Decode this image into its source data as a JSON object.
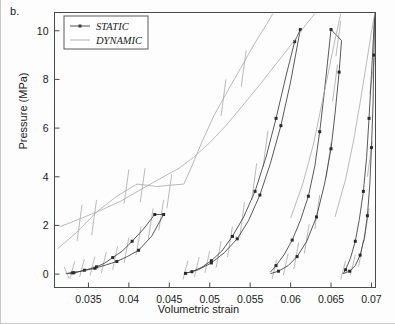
{
  "figure": {
    "panel_label": "b.",
    "background": "#fdfdfd"
  },
  "chart_data": {
    "type": "line",
    "title": "",
    "xlabel": "Volumetric strain",
    "ylabel": "Pressure (MPa)",
    "xlim": [
      0.0308,
      0.0705
    ],
    "ylim": [
      -0.55,
      10.75
    ],
    "xticks": [
      0.035,
      0.04,
      0.045,
      0.05,
      0.055,
      0.06,
      0.065,
      0.07
    ],
    "xticklabels": [
      "0.035",
      "0.04",
      "0.045",
      "0.05",
      "0.055",
      "0.06",
      "0.065",
      "0.07"
    ],
    "yticks": [
      0,
      2,
      4,
      6,
      8,
      10
    ],
    "yticklabels": [
      "0",
      "2",
      "4",
      "6",
      "8",
      "10"
    ],
    "grid": false,
    "legend": {
      "position": "top-left",
      "entries": [
        {
          "label": "STATIC",
          "style": "line-with-marker",
          "color": "#3c3c3c"
        },
        {
          "label": "DYNAMIC",
          "style": "line",
          "color": "#a8a8a8"
        }
      ]
    },
    "colors": {
      "static": "#3c3c3c",
      "dynamic": "#a8a8a8",
      "axis": "#4a4a4a",
      "text": "#1a1a1a"
    },
    "series": [
      {
        "name": "static-loop-1-load",
        "style": "static",
        "points": [
          [
            0.0322,
            0.02
          ],
          [
            0.033,
            0.05
          ],
          [
            0.0338,
            0.1
          ],
          [
            0.0345,
            0.16
          ],
          [
            0.0352,
            0.22
          ],
          [
            0.036,
            0.3
          ],
          [
            0.037,
            0.45
          ],
          [
            0.038,
            0.68
          ],
          [
            0.0392,
            0.95
          ],
          [
            0.0404,
            1.35
          ],
          [
            0.0418,
            1.85
          ],
          [
            0.0432,
            2.45
          ],
          [
            0.0443,
            2.45
          ]
        ],
        "markers": [
          [
            0.033,
            0.05
          ],
          [
            0.0345,
            0.16
          ],
          [
            0.036,
            0.3
          ],
          [
            0.038,
            0.68
          ],
          [
            0.0404,
            1.35
          ],
          [
            0.0432,
            2.45
          ],
          [
            0.0443,
            2.45
          ]
        ]
      },
      {
        "name": "static-loop-1-unload",
        "style": "static",
        "points": [
          [
            0.0443,
            2.45
          ],
          [
            0.0428,
            1.55
          ],
          [
            0.0412,
            0.98
          ],
          [
            0.0398,
            0.72
          ],
          [
            0.0385,
            0.52
          ],
          [
            0.0372,
            0.38
          ],
          [
            0.0358,
            0.24
          ],
          [
            0.0344,
            0.14
          ],
          [
            0.0332,
            0.06
          ],
          [
            0.0322,
            0.02
          ]
        ],
        "markers": [
          [
            0.0412,
            0.98
          ],
          [
            0.0385,
            0.52
          ],
          [
            0.0358,
            0.24
          ],
          [
            0.0332,
            0.06
          ]
        ]
      },
      {
        "name": "static-loop-2-load",
        "style": "static",
        "points": [
          [
            0.0468,
            0.02
          ],
          [
            0.0478,
            0.1
          ],
          [
            0.049,
            0.28
          ],
          [
            0.0502,
            0.55
          ],
          [
            0.0515,
            0.95
          ],
          [
            0.0528,
            1.55
          ],
          [
            0.0542,
            2.35
          ],
          [
            0.0556,
            3.4
          ],
          [
            0.057,
            4.85
          ],
          [
            0.0582,
            6.4
          ],
          [
            0.0594,
            8.1
          ],
          [
            0.0605,
            9.55
          ],
          [
            0.0612,
            10.05
          ]
        ],
        "markers": [
          [
            0.0478,
            0.1
          ],
          [
            0.0502,
            0.55
          ],
          [
            0.0528,
            1.55
          ],
          [
            0.0556,
            3.4
          ],
          [
            0.0582,
            6.4
          ],
          [
            0.0605,
            9.55
          ],
          [
            0.0612,
            10.05
          ]
        ]
      },
      {
        "name": "static-loop-2-unload",
        "style": "static",
        "points": [
          [
            0.0612,
            10.05
          ],
          [
            0.06,
            7.9
          ],
          [
            0.0588,
            6.1
          ],
          [
            0.0575,
            4.55
          ],
          [
            0.0562,
            3.25
          ],
          [
            0.0548,
            2.2
          ],
          [
            0.0534,
            1.45
          ],
          [
            0.0518,
            0.88
          ],
          [
            0.0502,
            0.46
          ],
          [
            0.0486,
            0.18
          ],
          [
            0.047,
            0.03
          ]
        ],
        "markers": [
          [
            0.0588,
            6.1
          ],
          [
            0.0562,
            3.25
          ],
          [
            0.0534,
            1.45
          ],
          [
            0.0502,
            0.46
          ],
          [
            0.047,
            0.03
          ]
        ]
      },
      {
        "name": "static-loop-3-load",
        "style": "static",
        "points": [
          [
            0.0575,
            0.02
          ],
          [
            0.0585,
            0.12
          ],
          [
            0.0597,
            0.35
          ],
          [
            0.0608,
            0.72
          ],
          [
            0.062,
            1.35
          ],
          [
            0.0632,
            2.35
          ],
          [
            0.0642,
            3.7
          ],
          [
            0.065,
            5.15
          ],
          [
            0.0655,
            6.6
          ],
          [
            0.066,
            8.3
          ],
          [
            0.0663,
            9.6
          ],
          [
            0.065,
            10.05
          ]
        ],
        "markers": [
          [
            0.0585,
            0.12
          ],
          [
            0.0608,
            0.72
          ],
          [
            0.0632,
            2.35
          ],
          [
            0.065,
            5.15
          ],
          [
            0.066,
            8.3
          ],
          [
            0.065,
            10.05
          ]
        ]
      },
      {
        "name": "static-loop-3-unload",
        "style": "static",
        "points": [
          [
            0.065,
            10.05
          ],
          [
            0.0642,
            7.55
          ],
          [
            0.0636,
            5.85
          ],
          [
            0.063,
            4.45
          ],
          [
            0.0622,
            3.2
          ],
          [
            0.0612,
            2.2
          ],
          [
            0.0602,
            1.4
          ],
          [
            0.0592,
            0.8
          ],
          [
            0.0582,
            0.35
          ],
          [
            0.0575,
            0.08
          ]
        ],
        "markers": [
          [
            0.0636,
            5.85
          ],
          [
            0.0622,
            3.2
          ],
          [
            0.0602,
            1.4
          ],
          [
            0.0582,
            0.35
          ]
        ]
      },
      {
        "name": "static-loop-4-load",
        "style": "static",
        "points": [
          [
            0.0665,
            0.02
          ],
          [
            0.0673,
            0.12
          ],
          [
            0.068,
            0.35
          ],
          [
            0.0686,
            0.78
          ],
          [
            0.0691,
            1.45
          ],
          [
            0.0695,
            2.4
          ],
          [
            0.0698,
            3.7
          ],
          [
            0.07,
            5.2
          ],
          [
            0.0702,
            7.0
          ],
          [
            0.0703,
            9.0
          ],
          [
            0.0704,
            10.7
          ]
        ],
        "markers": [
          [
            0.0673,
            0.12
          ],
          [
            0.0686,
            0.78
          ],
          [
            0.0695,
            2.4
          ],
          [
            0.07,
            5.2
          ],
          [
            0.0703,
            9.0
          ]
        ]
      },
      {
        "name": "static-loop-4-unload",
        "style": "static",
        "points": [
          [
            0.0704,
            10.7
          ],
          [
            0.07,
            8.2
          ],
          [
            0.0697,
            6.4
          ],
          [
            0.0694,
            4.8
          ],
          [
            0.069,
            3.4
          ],
          [
            0.0685,
            2.25
          ],
          [
            0.068,
            1.35
          ],
          [
            0.0674,
            0.65
          ],
          [
            0.0668,
            0.18
          ],
          [
            0.0665,
            0.02
          ]
        ],
        "markers": [
          [
            0.0697,
            6.4
          ],
          [
            0.069,
            3.4
          ],
          [
            0.068,
            1.35
          ],
          [
            0.0668,
            0.18
          ]
        ]
      },
      {
        "name": "dynamic-branch-upper-1",
        "style": "dynamic",
        "points": [
          [
            0.0315,
            1.95
          ],
          [
            0.034,
            2.28
          ],
          [
            0.0365,
            2.62
          ],
          [
            0.039,
            3.0
          ],
          [
            0.0415,
            3.48
          ],
          [
            0.044,
            3.95
          ],
          [
            0.0462,
            4.35
          ],
          [
            0.048,
            4.8
          ],
          [
            0.05,
            5.4
          ],
          [
            0.052,
            6.1
          ],
          [
            0.054,
            6.9
          ],
          [
            0.056,
            7.7
          ],
          [
            0.058,
            8.55
          ],
          [
            0.06,
            9.4
          ],
          [
            0.062,
            10.3
          ],
          [
            0.063,
            10.7
          ]
        ],
        "markers": []
      },
      {
        "name": "dynamic-branch-upper-2",
        "style": "dynamic",
        "points": [
          [
            0.0312,
            1.05
          ],
          [
            0.0335,
            1.7
          ],
          [
            0.036,
            2.55
          ],
          [
            0.0385,
            3.2
          ],
          [
            0.041,
            3.7
          ],
          [
            0.0435,
            3.6
          ],
          [
            0.045,
            3.65
          ],
          [
            0.0468,
            3.7
          ],
          [
            0.0478,
            4.45
          ],
          [
            0.049,
            5.4
          ],
          [
            0.0505,
            6.5
          ],
          [
            0.052,
            7.4
          ],
          [
            0.0538,
            8.45
          ],
          [
            0.0555,
            9.45
          ],
          [
            0.057,
            10.25
          ],
          [
            0.0578,
            10.7
          ]
        ],
        "markers": []
      },
      {
        "name": "dynamic-branch-right-1",
        "style": "dynamic",
        "points": [
          [
            0.06,
            2.3
          ],
          [
            0.0615,
            3.7
          ],
          [
            0.0628,
            5.3
          ],
          [
            0.0638,
            6.9
          ],
          [
            0.0648,
            8.5
          ],
          [
            0.0656,
            9.8
          ],
          [
            0.0662,
            10.7
          ]
        ],
        "markers": []
      },
      {
        "name": "dynamic-branch-right-2",
        "style": "dynamic",
        "points": [
          [
            0.0655,
            2.35
          ],
          [
            0.0668,
            3.9
          ],
          [
            0.0678,
            5.5
          ],
          [
            0.0686,
            7.05
          ],
          [
            0.0694,
            8.7
          ],
          [
            0.07,
            9.95
          ],
          [
            0.0704,
            10.7
          ]
        ],
        "markers": []
      },
      {
        "name": "dynamic-tick-group-low-left",
        "style": "dynamic",
        "points": [
          [
            0.032,
            0.3
          ],
          [
            0.0326,
            -0.18
          ]
        ],
        "markers": []
      }
    ],
    "dynamic_ticks": [
      [
        0.0333,
        0.52,
        0.0327,
        -0.18
      ],
      [
        0.0345,
        0.62,
        0.0339,
        -0.12
      ],
      [
        0.0358,
        0.72,
        0.0352,
        -0.05
      ],
      [
        0.0372,
        0.9,
        0.0366,
        0.05
      ],
      [
        0.0386,
        1.15,
        0.038,
        0.18
      ],
      [
        0.04,
        1.5,
        0.0394,
        0.45
      ],
      [
        0.0415,
        1.95,
        0.0409,
        0.8
      ],
      [
        0.043,
        2.7,
        0.0424,
        1.45
      ],
      [
        0.0443,
        3.05,
        0.0437,
        1.8
      ],
      [
        0.0342,
        2.85,
        0.0336,
        1.35
      ],
      [
        0.036,
        3.05,
        0.0354,
        1.6
      ],
      [
        0.04,
        4.3,
        0.0394,
        2.9
      ],
      [
        0.042,
        4.35,
        0.0414,
        2.95
      ],
      [
        0.0453,
        4.1,
        0.0447,
        2.7
      ],
      [
        0.0473,
        0.55,
        0.0467,
        -0.22
      ],
      [
        0.0487,
        0.7,
        0.0481,
        -0.12
      ],
      [
        0.05,
        0.95,
        0.0494,
        0.05
      ],
      [
        0.0514,
        1.35,
        0.0508,
        0.28
      ],
      [
        0.0528,
        1.95,
        0.0522,
        0.7
      ],
      [
        0.0543,
        2.95,
        0.0537,
        1.5
      ],
      [
        0.052,
        8.0,
        0.0514,
        6.5
      ],
      [
        0.0545,
        9.2,
        0.0539,
        7.7
      ],
      [
        0.0558,
        4.55,
        0.0552,
        3.05
      ],
      [
        0.0572,
        5.9,
        0.0566,
        4.4
      ],
      [
        0.0583,
        0.6,
        0.0577,
        -0.2
      ],
      [
        0.0597,
        0.85,
        0.0591,
        -0.05
      ],
      [
        0.061,
        1.3,
        0.0604,
        0.2
      ],
      [
        0.0623,
        2.05,
        0.0617,
        0.85
      ],
      [
        0.0636,
        3.25,
        0.063,
        1.85
      ],
      [
        0.065,
        5.4,
        0.0644,
        3.95
      ],
      [
        0.0658,
        8.6,
        0.0652,
        7.1
      ],
      [
        0.0662,
        10.4,
        0.0656,
        8.95
      ],
      [
        0.0668,
        0.55,
        0.0662,
        -0.22
      ],
      [
        0.068,
        0.8,
        0.0674,
        -0.05
      ],
      [
        0.069,
        1.4,
        0.0684,
        0.3
      ],
      [
        0.0697,
        2.7,
        0.0691,
        1.35
      ],
      [
        0.0701,
        5.45,
        0.0695,
        4.0
      ],
      [
        0.0704,
        8.9,
        0.0698,
        7.4
      ]
    ]
  }
}
